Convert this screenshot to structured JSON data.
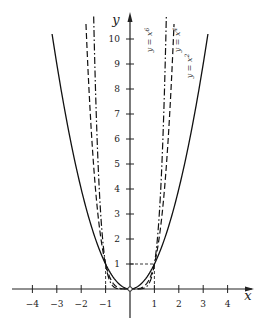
{
  "chart_data": {
    "type": "line",
    "title": "",
    "xlabel": "x",
    "ylabel": "y",
    "xlim": [
      -4.2,
      4.8
    ],
    "ylim": [
      0,
      11
    ],
    "grid": false,
    "x_ticks": [
      -4,
      -3,
      -2,
      -1,
      1,
      2,
      3,
      4
    ],
    "x_tick_labels": [
      "−4",
      "−3",
      "−2",
      "−1",
      "1",
      "2",
      "3",
      "4"
    ],
    "y_ticks": [
      1,
      2,
      3,
      4,
      5,
      6,
      7,
      8,
      9,
      10
    ],
    "y_tick_labels": [
      "1",
      "2",
      "3",
      "4",
      "5",
      "6",
      "7",
      "8",
      "9",
      "10"
    ],
    "series": [
      {
        "name": "y = x²",
        "function": "x^2",
        "style": "solid",
        "label_base": "y = x",
        "label_exp": "2"
      },
      {
        "name": "y = x⁴",
        "function": "x^4",
        "style": "dashed",
        "label_base": "y = x",
        "label_exp": "4"
      },
      {
        "name": "y = x⁶",
        "function": "x^6",
        "style": "dash-dot",
        "label_base": "y = x",
        "label_exp": "6"
      }
    ],
    "annotations": [
      {
        "type": "dashed-guide",
        "description": "horizontal dashed line at y = 1 from x = 0 to x = 1"
      },
      {
        "type": "dashed-guide",
        "description": "vertical dashed lines at x = -1 and x = 1 from y = 0 to y = 1"
      },
      {
        "type": "marker",
        "description": "open circle at origin (0, 0)"
      }
    ],
    "legend": "none (inline rotated labels near top right of curves)"
  },
  "axes": {
    "x_name": "x",
    "y_name": "y"
  }
}
